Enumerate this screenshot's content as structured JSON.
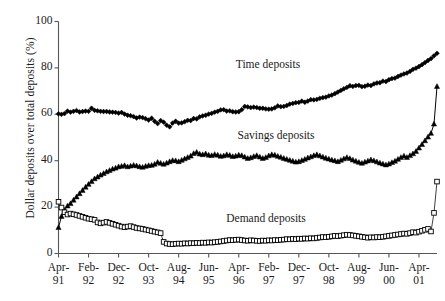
{
  "chart_data": {
    "type": "line",
    "title": "",
    "xlabel": "",
    "ylabel": "Dollar deposits over total deposits (%)",
    "ylim": [
      0,
      100
    ],
    "yticks": [
      0,
      20,
      40,
      60,
      80,
      100
    ],
    "grid": false,
    "legend_position": "inline-annotations",
    "x_tick_labels": [
      {
        "line1": "Apr-",
        "line2": "91"
      },
      {
        "line1": "Feb-",
        "line2": "92"
      },
      {
        "line1": "Dec-",
        "line2": "92"
      },
      {
        "line1": "Oct-",
        "line2": "93"
      },
      {
        "line1": "Aug-",
        "line2": "94"
      },
      {
        "line1": "Jun-",
        "line2": "95"
      },
      {
        "line1": "Apr-",
        "line2": "96"
      },
      {
        "line1": "Feb-",
        "line2": "97"
      },
      {
        "line1": "Dec-",
        "line2": "97"
      },
      {
        "line1": "Oct-",
        "line2": "98"
      },
      {
        "line1": "Aug-",
        "line2": "99"
      },
      {
        "line1": "Jun-",
        "line2": "00"
      },
      {
        "line1": "Apr-",
        "line2": "01"
      }
    ],
    "x_tick_indices": [
      0,
      10,
      20,
      30,
      40,
      50,
      60,
      70,
      80,
      90,
      100,
      110,
      120
    ],
    "x_index_range": [
      0,
      126
    ],
    "series": [
      {
        "name": "Time deposits",
        "marker": "filled-diamond",
        "color": "#000000",
        "label_x": 268,
        "label_y": 64,
        "values": [
          60.2,
          60.0,
          60.3,
          61.4,
          60.9,
          61.3,
          61.6,
          61.0,
          61.2,
          61.4,
          61.3,
          62.6,
          61.7,
          61.5,
          61.3,
          61.2,
          61.2,
          61.0,
          60.9,
          60.8,
          60.5,
          60.8,
          60.1,
          59.6,
          59.4,
          59.0,
          58.4,
          58.8,
          58.6,
          58.1,
          57.5,
          58.3,
          57.0,
          56.0,
          57.3,
          56.6,
          55.3,
          54.6,
          56.2,
          57.0,
          56.2,
          56.3,
          56.8,
          57.4,
          57.3,
          58.2,
          58.0,
          58.9,
          59.3,
          59.6,
          60.1,
          60.4,
          60.9,
          61.3,
          61.9,
          62.0,
          61.4,
          61.5,
          61.1,
          61.0,
          61.1,
          62.0,
          63.4,
          63.2,
          62.9,
          63.1,
          62.9,
          62.6,
          62.6,
          62.3,
          62.2,
          62.3,
          62.8,
          63.6,
          63.3,
          63.4,
          63.8,
          64.4,
          64.7,
          65.0,
          65.1,
          65.7,
          65.2,
          65.7,
          66.3,
          66.2,
          66.4,
          66.9,
          67.2,
          67.4,
          67.9,
          68.3,
          68.9,
          69.6,
          70.3,
          71.0,
          71.6,
          72.3,
          72.0,
          72.4,
          72.5,
          71.9,
          72.1,
          72.6,
          72.4,
          73.1,
          73.5,
          73.6,
          74.3,
          74.1,
          74.9,
          75.4,
          75.6,
          76.3,
          76.9,
          77.4,
          77.8,
          78.5,
          79.4,
          79.9,
          80.6,
          81.4,
          82.3,
          83.2,
          84.0,
          85.2,
          86.3
        ]
      },
      {
        "name": "Savings deposits",
        "marker": "filled-triangle",
        "color": "#000000",
        "label_x": 276,
        "label_y": 135,
        "values": [
          11.2,
          16.0,
          18.6,
          20.5,
          21.5,
          23.0,
          24.4,
          25.8,
          27.2,
          28.6,
          29.8,
          31.0,
          32.2,
          33.0,
          33.8,
          34.5,
          35.2,
          35.8,
          36.4,
          36.8,
          37.4,
          37.6,
          37.9,
          37.4,
          37.7,
          38.0,
          37.8,
          37.4,
          37.2,
          37.6,
          37.9,
          38.0,
          38.5,
          39.3,
          38.9,
          38.5,
          39.0,
          39.6,
          40.1,
          40.0,
          39.6,
          40.2,
          40.8,
          41.4,
          42.0,
          43.1,
          43.6,
          42.9,
          42.6,
          43.0,
          42.4,
          42.2,
          42.7,
          42.4,
          41.9,
          42.1,
          42.6,
          42.3,
          41.8,
          42.0,
          42.4,
          42.2,
          41.6,
          41.0,
          41.3,
          41.8,
          42.2,
          41.6,
          41.0,
          41.4,
          42.1,
          42.6,
          42.4,
          41.9,
          41.5,
          41.0,
          40.6,
          40.2,
          39.8,
          39.4,
          39.6,
          40.1,
          40.6,
          41.2,
          41.7,
          42.2,
          42.6,
          42.1,
          41.6,
          41.1,
          40.7,
          40.3,
          40.0,
          39.6,
          40.2,
          40.8,
          41.4,
          40.9,
          40.3,
          39.8,
          39.3,
          38.9,
          39.4,
          39.9,
          40.4,
          40.0,
          39.5,
          39.0,
          38.6,
          38.2,
          38.6,
          39.2,
          39.8,
          40.6,
          41.4,
          42.0,
          41.4,
          42.2,
          43.0,
          44.0,
          45.5,
          47.0,
          48.6,
          50.2,
          51.8,
          55.8,
          72.0
        ]
      },
      {
        "name": "Demand deposits",
        "marker": "open-square",
        "color": "#000000",
        "label_x": 266,
        "label_y": 218,
        "values": [
          22.3,
          19.8,
          17.8,
          16.8,
          17.2,
          16.9,
          16.6,
          16.2,
          15.8,
          15.4,
          15.0,
          14.8,
          14.5,
          13.4,
          13.0,
          13.3,
          13.6,
          13.2,
          12.8,
          12.4,
          12.0,
          11.6,
          11.3,
          11.6,
          11.8,
          11.4,
          11.0,
          10.8,
          10.6,
          10.3,
          10.0,
          9.7,
          9.4,
          9.1,
          8.8,
          5.0,
          4.3,
          4.1,
          4.0,
          4.2,
          4.3,
          4.2,
          4.4,
          4.3,
          4.5,
          4.4,
          4.6,
          4.5,
          4.7,
          4.6,
          4.8,
          4.7,
          4.9,
          5.0,
          5.2,
          5.4,
          5.6,
          5.8,
          5.7,
          5.9,
          6.0,
          5.8,
          5.6,
          5.5,
          5.7,
          5.6,
          5.5,
          5.4,
          5.6,
          5.5,
          5.7,
          5.6,
          5.8,
          5.7,
          5.9,
          6.0,
          6.2,
          6.1,
          6.3,
          6.2,
          6.4,
          6.3,
          6.5,
          6.4,
          6.6,
          6.5,
          6.7,
          6.9,
          7.1,
          7.0,
          7.2,
          7.4,
          7.6,
          7.5,
          7.7,
          7.9,
          8.1,
          8.0,
          7.8,
          7.6,
          7.4,
          7.2,
          7.0,
          6.8,
          7.0,
          6.9,
          7.1,
          7.0,
          7.2,
          7.4,
          7.6,
          7.8,
          8.0,
          8.2,
          8.4,
          8.6,
          8.5,
          8.8,
          9.2,
          9.0,
          9.4,
          9.8,
          10.2,
          10.6,
          9.5,
          17.5,
          31.0
        ]
      }
    ]
  }
}
